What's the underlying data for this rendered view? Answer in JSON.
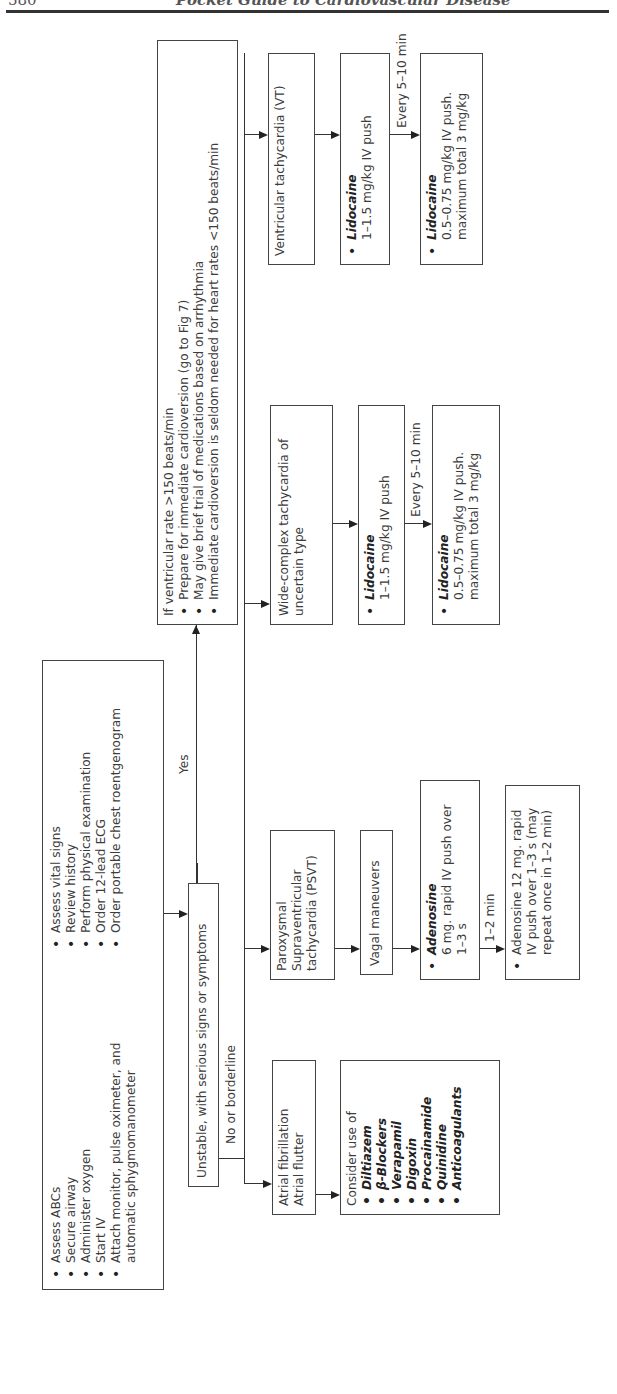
{
  "page_header": {
    "page_number": "580",
    "running_title": "Pocket Guide to Cardiovascular Disease"
  },
  "initial_assessment": {
    "col1": [
      "Assess ABCs",
      "Secure airway",
      "Administer oxygen",
      "Start IV",
      "Attach monitor, pulse oximeter, and automatic sphygmomanometer"
    ],
    "col2": [
      "Assess vital signs",
      "Review history",
      "Perform physical examination",
      "Order 12-lead ECG",
      "Order portable chest roentgenogram"
    ]
  },
  "decision": {
    "label": "Unstable, with serious signs or symptoms",
    "yes_label": "Yes",
    "no_label": "No or borderline"
  },
  "unstable_branch": {
    "heading": "If ventricular rate >150 beats/min",
    "items": [
      "Prepare for immediate cardioversion (go to Fig 7)",
      "May give brief trial of medications based on arrhythmia",
      "Immediate cardioversion is seldom needed for heart rates <150 beats/min"
    ]
  },
  "atrial": {
    "title_line1": "Atrial fibrillation",
    "title_line2": "Atrial flutter",
    "consider_heading": "Consider use of",
    "drugs": [
      "Diltiazem",
      "β-Blockers",
      "Verapamil",
      "Digoxin",
      "Procainamide",
      "Quinidine",
      "Anticoagulants"
    ]
  },
  "psvt": {
    "title": "Paroxysmal Supraventricular tachycardia (PSVT)",
    "step2": "Vagal maneuvers",
    "step3_drug": "Adenosine",
    "step3_dose": "6 mg. rapid IV push over 1–3 s",
    "interval": "1–2 min",
    "step4_dose": "Adenosine 12 mg. rapid IV push over 1–3 s (may repeat once in 1–2 min)"
  },
  "wide_complex": {
    "title": "Wide-complex tachycardia of uncertain type",
    "step2_drug": "Lidocaine",
    "step2_dose": "1–1.5 mg/kg IV push",
    "interval": "Every 5–10 min",
    "step3_drug": "Lidocaine",
    "step3_dose": "0.5–0.75 mg/kg IV push. maximum total 3 mg/kg"
  },
  "vt": {
    "title": "Ventricular tachycardia (VT)",
    "step2_drug": "Lidocaine",
    "step2_dose": "1–1.5 mg/kg IV push",
    "interval": "Every 5–10 min",
    "step3_drug": "Lidocaine",
    "step3_dose": "0.5–0.75 mg/kg IV push. maximum total 3 mg/kg"
  }
}
